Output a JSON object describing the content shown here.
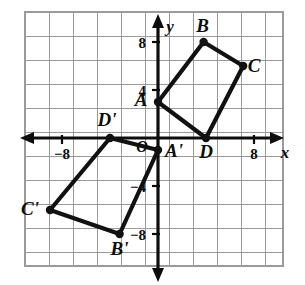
{
  "figure": {
    "background_color": "#ffffff",
    "grid_color": "#9a9a9a",
    "axis_color": "#0d0d0d",
    "shape_color": "#111111"
  },
  "axes": {
    "x_label": "x",
    "y_label": "y",
    "origin_label": "O",
    "x_ticks": [
      {
        "value": -8,
        "label": "−8"
      },
      {
        "value": 8,
        "label": "8"
      }
    ],
    "y_ticks": [
      {
        "value": 8,
        "label": "8"
      },
      {
        "value": 4,
        "label": "4"
      },
      {
        "value": -4,
        "label": "−4"
      },
      {
        "value": -8,
        "label": "−8"
      }
    ],
    "x_range": [
      -10,
      10
    ],
    "y_range": [
      -10,
      10
    ],
    "grid_step": 2,
    "grid_visible": true
  },
  "chart_data": {
    "type": "scatter",
    "xlabel": "x",
    "ylabel": "y",
    "xlim": [
      -10,
      10
    ],
    "ylim": [
      -10,
      10
    ],
    "grid": true,
    "grid_step": 2,
    "legend": "none",
    "series": [
      {
        "name": "ABCD",
        "closed": true,
        "points": [
          {
            "label": "A",
            "x": 0,
            "y": 3,
            "label_dx": -17,
            "label_dy": 4
          },
          {
            "label": "B",
            "x": 3.8,
            "y": 8,
            "label_dx": -1,
            "label_dy": -10
          },
          {
            "label": "C",
            "x": 7.1,
            "y": 6,
            "label_dx": 11,
            "label_dy": 6
          },
          {
            "label": "D",
            "x": 4,
            "y": 0,
            "label_dx": 0,
            "label_dy": 20
          }
        ]
      },
      {
        "name": "A'B'C'D'",
        "closed": true,
        "points": [
          {
            "label": "A'",
            "x": 0,
            "y": -1,
            "label_dx": 16,
            "label_dy": 7
          },
          {
            "label": "B'",
            "x": -3.2,
            "y": -8,
            "label_dx": 0,
            "label_dy": 21
          },
          {
            "label": "C'",
            "x": -9,
            "y": -6,
            "label_dx": -20,
            "label_dy": 5
          },
          {
            "label": "D'",
            "x": -4,
            "y": 0,
            "label_dx": -3,
            "label_dy": -12
          }
        ]
      }
    ]
  }
}
